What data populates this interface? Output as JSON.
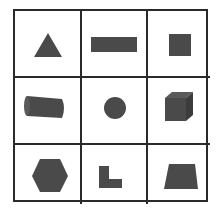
{
  "puzzle": {
    "rows": 3,
    "columns": 3,
    "shape_color": "#4a4a4a",
    "line_color": "#2a2a2a",
    "cells": [
      {
        "row": 1,
        "col": 1,
        "shape": "triangle"
      },
      {
        "row": 1,
        "col": 2,
        "shape": "rectangle"
      },
      {
        "row": 1,
        "col": 3,
        "shape": "square"
      },
      {
        "row": 2,
        "col": 1,
        "shape": "cylinder"
      },
      {
        "row": 2,
        "col": 2,
        "shape": "circle"
      },
      {
        "row": 2,
        "col": 3,
        "shape": "cube"
      },
      {
        "row": 3,
        "col": 1,
        "shape": "hexagon"
      },
      {
        "row": 3,
        "col": 2,
        "shape": "l-shape"
      },
      {
        "row": 3,
        "col": 3,
        "shape": "trapezoid"
      }
    ]
  }
}
